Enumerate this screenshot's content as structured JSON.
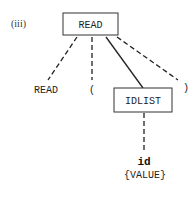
{
  "diagram": {
    "label": "(iii)",
    "root": {
      "text": "READ"
    },
    "children": [
      {
        "text": "READ",
        "edge": "dashed"
      },
      {
        "text": "(",
        "edge": "dashed"
      },
      {
        "text": "IDLIST",
        "edge": "solid",
        "boxed": true
      },
      {
        "text": ")",
        "edge": "dashed"
      }
    ],
    "idlist_child": {
      "text": "id",
      "attribute": "{VALUE}",
      "edge": "dashed"
    }
  }
}
